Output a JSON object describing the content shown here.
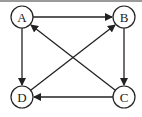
{
  "diagram": {
    "type": "directed-graph",
    "nodes": [
      {
        "id": "A",
        "label": "A",
        "x": 22,
        "y": 17
      },
      {
        "id": "B",
        "label": "B",
        "x": 124,
        "y": 17
      },
      {
        "id": "C",
        "label": "C",
        "x": 124,
        "y": 97
      },
      {
        "id": "D",
        "label": "D",
        "x": 22,
        "y": 97
      }
    ],
    "edges": [
      {
        "from": "A",
        "to": "B"
      },
      {
        "from": "A",
        "to": "D"
      },
      {
        "from": "B",
        "to": "C"
      },
      {
        "from": "C",
        "to": "D"
      },
      {
        "from": "C",
        "to": "A"
      },
      {
        "from": "D",
        "to": "B"
      }
    ],
    "colors": {
      "stroke": "#222222",
      "border": "#9a9a9a"
    }
  }
}
